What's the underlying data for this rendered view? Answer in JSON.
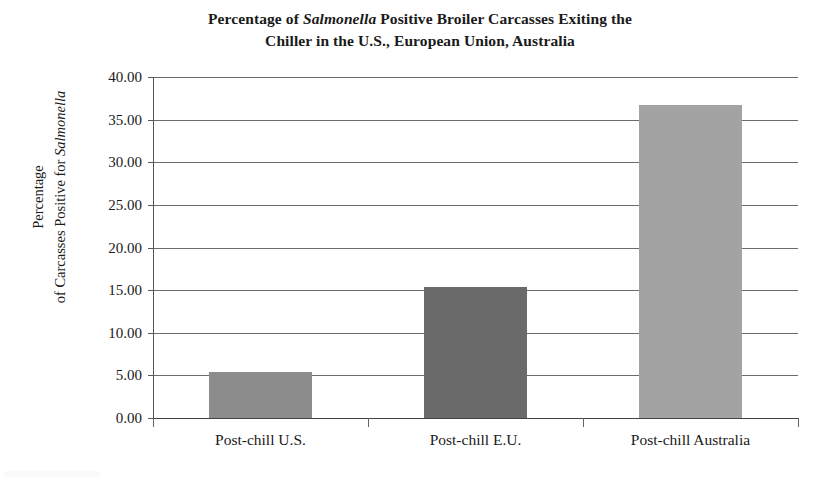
{
  "chart_data": {
    "type": "bar",
    "title": "Percentage of Salmonella Positive Broiler Carcasses Exiting the Chiller in the U.S., European Union, Australia",
    "title_line1_pre": "Percentage of ",
    "title_line1_italic": "Salmonella",
    "title_line1_post": " Positive Broiler Carcasses Exiting the",
    "title_line2": "Chiller in the U.S., European Union, Australia",
    "xlabel": "",
    "ylabel": "Percentage of Carcasses Positive for Salmonella",
    "ylabel_line1": "Percentage",
    "ylabel_line2_pre": "of Carcasses Positive for ",
    "ylabel_line2_italic": "Salmonella",
    "categories": [
      "Post-chill U.S.",
      "Post-chill E.U.",
      "Post-chill Australia"
    ],
    "values": [
      5.4,
      15.4,
      36.7
    ],
    "ylim": [
      0,
      40
    ],
    "ytick_step": 5,
    "ytick_labels": [
      "40.00",
      "35.00",
      "30.00",
      "25.00",
      "20.00",
      "15.00",
      "10.00",
      "5.00",
      "0.00"
    ],
    "ytick_values": [
      40,
      35,
      30,
      25,
      20,
      15,
      10,
      5,
      0
    ],
    "grid": true,
    "legend": "none",
    "bar_colors": [
      "#8c8c8c",
      "#6a6a6a",
      "#a3a3a3"
    ],
    "axis_color": "#555555",
    "grid_color": "#6b6b6b",
    "text_color": "#1a1a1a",
    "background": "#ffffff"
  }
}
